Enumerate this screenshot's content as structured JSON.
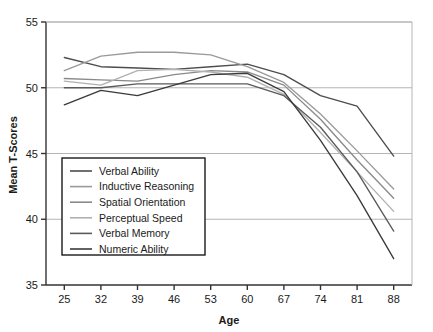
{
  "chart_data": {
    "type": "line",
    "title": "",
    "xlabel": "Age",
    "ylabel": "Mean T-Scores",
    "categories": [
      25,
      32,
      39,
      46,
      53,
      60,
      67,
      74,
      81,
      88
    ],
    "x": [
      25,
      32,
      39,
      46,
      53,
      60,
      67,
      74,
      81,
      88
    ],
    "xlim": [
      21.5,
      91.5
    ],
    "ylim": [
      35,
      55
    ],
    "xticks": [
      "25",
      "32",
      "39",
      "46",
      "53",
      "60",
      "67",
      "74",
      "81",
      "88"
    ],
    "yticks": [
      "35",
      "40",
      "45",
      "50",
      "55"
    ],
    "grid": "horizontal",
    "legend_position": "lower-left-inside",
    "series": [
      {
        "name": "Verbal Ability",
        "color": "#4d4d4d",
        "values": [
          52.3,
          51.6,
          51.5,
          51.4,
          51.6,
          51.8,
          51.0,
          49.4,
          48.6,
          44.8
        ]
      },
      {
        "name": "Inductive Reasoning",
        "color": "#9a9a9a",
        "values": [
          51.3,
          52.4,
          52.7,
          52.7,
          52.5,
          51.6,
          50.4,
          48.0,
          45.2,
          42.3
        ]
      },
      {
        "name": "Spatial Orientation",
        "color": "#8a8a8a",
        "values": [
          50.7,
          50.6,
          50.5,
          51.0,
          51.3,
          51.2,
          50.2,
          47.6,
          44.5,
          41.6
        ]
      },
      {
        "name": "Perceptual Speed",
        "color": "#b0b0b0",
        "values": [
          50.5,
          50.2,
          51.3,
          51.4,
          51.2,
          50.8,
          49.5,
          46.6,
          43.6,
          40.6
        ]
      },
      {
        "name": "Verbal Memory",
        "color": "#5a5a5a",
        "values": [
          50.0,
          50.0,
          50.3,
          50.3,
          50.3,
          50.3,
          49.4,
          47.0,
          43.6,
          39.1
        ]
      },
      {
        "name": "Numeric Ability",
        "color": "#3a3a3a",
        "values": [
          48.7,
          49.8,
          49.4,
          50.2,
          51.0,
          51.1,
          49.7,
          46.0,
          41.8,
          37.0
        ]
      }
    ]
  },
  "legend": {
    "items": [
      {
        "label": "Verbal Ability"
      },
      {
        "label": "Inductive Reasoning"
      },
      {
        "label": "Spatial Orientation"
      },
      {
        "label": "Perceptual Speed"
      },
      {
        "label": "Verbal Memory"
      },
      {
        "label": "Numeric Ability"
      }
    ]
  },
  "colors": {
    "axis": "#333333",
    "grid": "#b5b5b5",
    "text": "#1a1a1a",
    "background": "#ffffff"
  }
}
